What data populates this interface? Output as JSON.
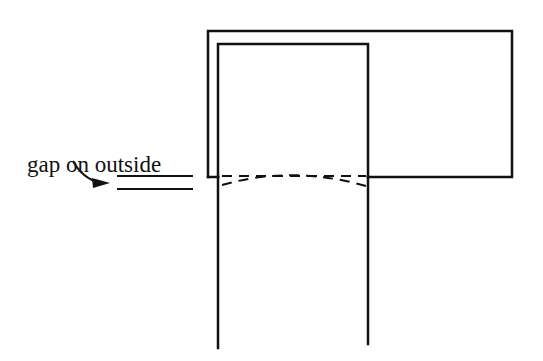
{
  "diagram": {
    "annotation": "gap on outside",
    "stroke_color": "#111111",
    "background": "#ffffff"
  }
}
